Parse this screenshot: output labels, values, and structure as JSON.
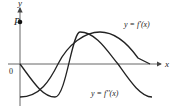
{
  "diagram": {
    "title": "",
    "axes": {
      "x_label": "x",
      "y_label": "y",
      "origin_label": "0"
    },
    "point": {
      "label": "P"
    },
    "curves": [
      {
        "name": "f-prime",
        "label": "y = f'(x)",
        "shape": "negative cosine",
        "color": "#222222"
      },
      {
        "name": "f-double-prime",
        "label": "y = f''(x)",
        "shape": "negative sine",
        "color": "#222222"
      }
    ]
  }
}
